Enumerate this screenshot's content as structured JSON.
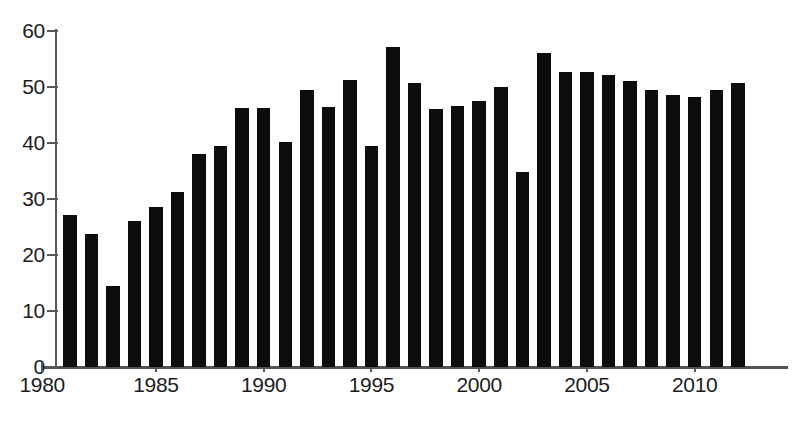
{
  "chart_data": {
    "type": "bar",
    "title": "",
    "subtitle": "",
    "xlabel": "",
    "ylabel": "",
    "xlim": [
      1980,
      2012.5
    ],
    "ylim": [
      0,
      60
    ],
    "grid": false,
    "legend": null,
    "y_ticks": [
      0,
      10,
      20,
      30,
      40,
      50,
      60
    ],
    "x_ticks": [
      1980,
      1985,
      1990,
      1995,
      2000,
      2005,
      2010
    ],
    "x_tick_labels": [
      "1980",
      "1985",
      "1990",
      "1995",
      "2000",
      "2005",
      "2010"
    ],
    "y_tick_labels": [
      "0",
      "10",
      "20",
      "30",
      "40",
      "50",
      "60"
    ],
    "bar_color": "#0d0d0d",
    "categories": [
      "1981",
      "1982",
      "1983",
      "1984",
      "1985",
      "1986",
      "1987",
      "1988",
      "1989",
      "1990",
      "1991",
      "1992",
      "1993",
      "1994",
      "1995",
      "1996",
      "1997",
      "1998",
      "1999",
      "2000",
      "2001",
      "2002",
      "2003",
      "2004",
      "2005",
      "2006",
      "2007",
      "2008",
      "2009",
      "2010",
      "2011",
      "2012"
    ],
    "values": [
      27.2,
      23.7,
      14.4,
      26.0,
      28.6,
      31.2,
      38.0,
      39.5,
      46.2,
      46.2,
      40.2,
      49.4,
      46.5,
      51.3,
      39.4,
      57.2,
      50.8,
      46.0,
      46.6,
      47.5,
      50.0,
      34.8,
      56.0,
      52.7,
      52.7,
      52.2,
      51.0,
      49.4,
      48.5,
      48.3,
      49.4,
      50.7
    ]
  },
  "caption": {
    "fragment": ""
  }
}
